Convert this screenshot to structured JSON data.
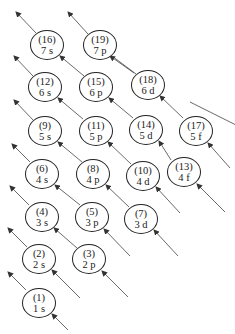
{
  "colors": {
    "line": "#333333",
    "circle": "#222222"
  },
  "orbitals": [
    {
      "order": "(1)",
      "label": "1 s",
      "x": 39,
      "y": 303
    },
    {
      "order": "(2)",
      "label": "2 s",
      "x": 39,
      "y": 259
    },
    {
      "order": "(3)",
      "label": "2 p",
      "x": 89,
      "y": 259
    },
    {
      "order": "(4)",
      "label": "3 s",
      "x": 42,
      "y": 217
    },
    {
      "order": "(5)",
      "label": "3 p",
      "x": 92,
      "y": 217
    },
    {
      "order": "(6)",
      "label": "4 s",
      "x": 42,
      "y": 174
    },
    {
      "order": "(7)",
      "label": "3 d",
      "x": 141,
      "y": 219
    },
    {
      "order": "(8)",
      "label": "4 p",
      "x": 93,
      "y": 174
    },
    {
      "order": "(9)",
      "label": "5 s",
      "x": 45,
      "y": 131
    },
    {
      "order": "(10)",
      "label": "4 d",
      "x": 143,
      "y": 176
    },
    {
      "order": "(11)",
      "label": "5 p",
      "x": 96,
      "y": 131
    },
    {
      "order": "(12)",
      "label": "6 s",
      "x": 45,
      "y": 87
    },
    {
      "order": "(13)",
      "label": "4 f",
      "x": 184,
      "y": 172
    },
    {
      "order": "(14)",
      "label": "5 d",
      "x": 146,
      "y": 130
    },
    {
      "order": "(15)",
      "label": "6 p",
      "x": 96,
      "y": 87
    },
    {
      "order": "(16)",
      "label": "7 s",
      "x": 47,
      "y": 45
    },
    {
      "order": "(17)",
      "label": "5 f",
      "x": 196,
      "y": 131
    },
    {
      "order": "(18)",
      "label": "6 d",
      "x": 148,
      "y": 85
    },
    {
      "order": "(19)",
      "label": "7 p",
      "x": 100,
      "y": 45
    }
  ]
}
